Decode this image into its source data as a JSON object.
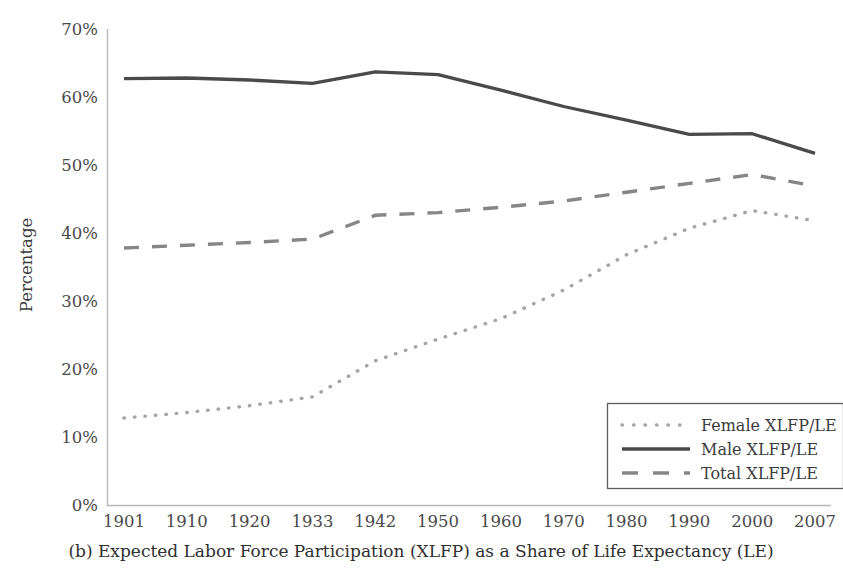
{
  "chart_data": {
    "type": "line",
    "title": "",
    "caption": "(b) Expected Labor Force Participation (XLFP) as a Share of Life Expectancy (LE)",
    "xlabel": "",
    "ylabel": "Percentage",
    "categories": [
      "1901",
      "1910",
      "1920",
      "1933",
      "1942",
      "1950",
      "1960",
      "1970",
      "1980",
      "1990",
      "2000",
      "2007"
    ],
    "yticks": [
      "0%",
      "10%",
      "20%",
      "30%",
      "40%",
      "50%",
      "60%",
      "70%"
    ],
    "ytick_values": [
      0,
      10,
      20,
      30,
      40,
      50,
      60,
      70
    ],
    "ylim": [
      0,
      70
    ],
    "grid": false,
    "legend_position": "bottom-right",
    "series": [
      {
        "name": "Female XLFP/LE",
        "style": "dotted",
        "color": "#a5a5a5",
        "values": [
          12.8,
          13.6,
          14.6,
          15.9,
          21.2,
          24.4,
          27.4,
          31.6,
          36.8,
          40.7,
          43.3,
          41.8
        ]
      },
      {
        "name": "Male XLFP/LE",
        "style": "solid",
        "color": "#4a4a4a",
        "values": [
          62.7,
          62.8,
          62.5,
          62.0,
          63.7,
          63.3,
          61.0,
          58.6,
          56.6,
          54.5,
          54.6,
          51.7
        ]
      },
      {
        "name": "Total XLFP/LE",
        "style": "dashed",
        "color": "#868686",
        "values": [
          37.8,
          38.2,
          38.6,
          39.1,
          42.6,
          43.0,
          43.8,
          44.7,
          46.0,
          47.3,
          48.6,
          46.9
        ]
      }
    ]
  },
  "legend": {
    "items": [
      {
        "label": "Female XLFP/LE",
        "swatch": "dotted-line-swatch"
      },
      {
        "label": "Male XLFP/LE",
        "swatch": "solid-line-swatch"
      },
      {
        "label": "Total XLFP/LE",
        "swatch": "dashed-line-swatch"
      }
    ]
  },
  "colors": {
    "female": "#a5a5a5",
    "male": "#4a4a4a",
    "total": "#868686",
    "axis": "#b9b9b9",
    "text": "#3c3c3c",
    "background": "#ffffff"
  }
}
